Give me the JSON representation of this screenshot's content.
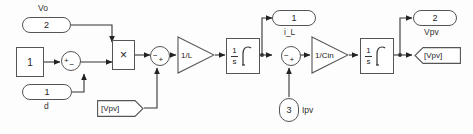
{
  "diagram": {
    "background_color": "#fdfdfd",
    "line_color": "#333333",
    "block_border_color": "#555555",
    "block_fill_color": "#ffffff"
  },
  "ports": {
    "vo_in": {
      "number": "2",
      "label": "Vo"
    },
    "d_in": {
      "number": "1",
      "label": "d"
    },
    "ipv_in": {
      "number": "3",
      "label": "Ipv"
    },
    "il_out": {
      "number": "1",
      "label": "i_L"
    },
    "vpv_out": {
      "number": "2",
      "label": "Vpv"
    }
  },
  "blocks": {
    "constant_one": {
      "value": "1"
    },
    "product": {
      "symbol": "×"
    },
    "gain_inductor": {
      "value": "1/L"
    },
    "gain_capacitor": {
      "value": "1/Cin"
    },
    "integrator_current": {
      "numerator": "1",
      "denominator": "s"
    },
    "integrator_voltage": {
      "numerator": "1",
      "denominator": "s"
    }
  },
  "sums": {
    "sum_duty": {
      "sign_left": "+",
      "sign_bottom": "−"
    },
    "sum_voltage": {
      "sign_left": "−",
      "sign_bottom": "+"
    },
    "sum_current": {
      "sign_left": "−",
      "sign_bottom": "+"
    }
  },
  "tags": {
    "from_vpv": {
      "label": "[Vpv]",
      "kind": "from"
    },
    "goto_vpv": {
      "label": "[Vpv]",
      "kind": "goto"
    }
  }
}
